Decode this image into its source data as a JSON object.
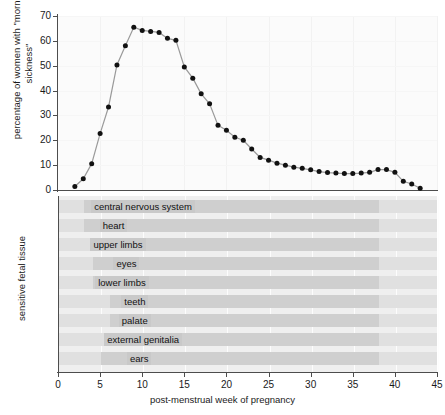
{
  "chart_title": "",
  "chart_data": {
    "type": "line",
    "title": "",
    "subtitle": "",
    "xlabel": "post-menstrual week of pregnancy",
    "ylabel": "percentage of women with \"morning sickness\"",
    "xlim": [
      0,
      45
    ],
    "ylim": [
      0,
      70
    ],
    "xticks": [
      0,
      5,
      10,
      15,
      20,
      25,
      30,
      35,
      40,
      45
    ],
    "yticks": [
      0,
      10,
      20,
      30,
      40,
      50,
      60,
      70
    ],
    "grid": true,
    "legend": "none",
    "marker": "filled-circle",
    "line_color": "#9a9a9a",
    "marker_color": "#111111",
    "series": [
      {
        "name": "percentage of women with morning sickness",
        "x": [
          2,
          3,
          4,
          5,
          6,
          7,
          8,
          9,
          10,
          11,
          12,
          13,
          14,
          15,
          16,
          17,
          18,
          19,
          20,
          21,
          22,
          23,
          24,
          25,
          26,
          27,
          28,
          29,
          30,
          31,
          32,
          33,
          34,
          35,
          36,
          37,
          38,
          39,
          40,
          41,
          42,
          43
        ],
        "y": [
          1.4,
          4.5,
          10.6,
          22.7,
          33.4,
          50.3,
          58.0,
          65.5,
          64.2,
          63.8,
          63.4,
          61.0,
          60.2,
          49.5,
          45.0,
          38.7,
          34.7,
          26.0,
          24.0,
          21.2,
          20.0,
          16.5,
          13.1,
          12.0,
          10.8,
          10.0,
          9.2,
          8.7,
          8.1,
          7.4,
          7.0,
          6.8,
          6.6,
          6.6,
          6.8,
          7.1,
          8.2,
          8.2,
          7.1,
          3.5,
          2.4,
          0.7
        ]
      }
    ],
    "secondary_panel": {
      "type": "bar",
      "ylabel": "sensitive fetal tissue",
      "xlabel": "post-menstrual week of pregnancy",
      "xlim": [
        0,
        45
      ],
      "rows": [
        {
          "label": "central nervous system",
          "start": 3,
          "end": 38,
          "sensitive_start": 3,
          "sensitive_end": 17
        },
        {
          "label": "heart",
          "start": 3,
          "end": 38,
          "sensitive_start": 3,
          "sensitive_end": 10
        },
        {
          "label": "upper limbs",
          "start": 4,
          "end": 38,
          "sensitive_start": 4,
          "sensitive_end": 10
        },
        {
          "label": "eyes",
          "start": 4,
          "end": 38,
          "sensitive_start": 4,
          "sensitive_end": 12
        },
        {
          "label": "lower limbs",
          "start": 4,
          "end": 38,
          "sensitive_start": 4,
          "sensitive_end": 11
        },
        {
          "label": "teeth",
          "start": 6,
          "end": 38,
          "sensitive_start": 6,
          "sensitive_end": 12
        },
        {
          "label": "palate",
          "start": 6,
          "end": 38,
          "sensitive_start": 6,
          "sensitive_end": 12
        },
        {
          "label": "external genitalia",
          "start": 6,
          "end": 38,
          "sensitive_start": 6,
          "sensitive_end": 14
        },
        {
          "label": "ears",
          "start": 5,
          "end": 38,
          "sensitive_start": 5,
          "sensitive_end": 14
        }
      ]
    }
  }
}
